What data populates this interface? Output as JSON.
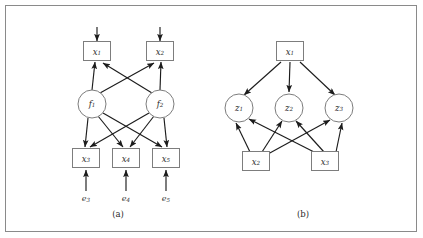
{
  "figure": {
    "background_color": "#ffffff",
    "border_color": "#8a8a8a",
    "edge_color": "#1c1c1c",
    "node_stroke_color": "#7d7d7d"
  },
  "panels": [
    {
      "id": "a",
      "caption": "(a)",
      "caption_x": 118,
      "caption_y": 214,
      "observed_top": [
        {
          "name": "x1",
          "label": "x",
          "sub": "1",
          "x": 97,
          "y": 51,
          "w": 27,
          "h": 19
        },
        {
          "name": "x2",
          "label": "x",
          "sub": "2",
          "x": 160,
          "y": 51,
          "w": 27,
          "h": 19
        }
      ],
      "latent": [
        {
          "name": "f1",
          "label": "f",
          "sub": "1",
          "x": 92,
          "y": 104,
          "r": 14
        },
        {
          "name": "f2",
          "label": "f",
          "sub": "2",
          "x": 160,
          "y": 104,
          "r": 14
        }
      ],
      "observed_bottom": [
        {
          "name": "x3",
          "label": "x",
          "sub": "3",
          "x": 86,
          "y": 158,
          "w": 27,
          "h": 19
        },
        {
          "name": "x4",
          "label": "x",
          "sub": "4",
          "x": 126,
          "y": 158,
          "w": 27,
          "h": 19
        },
        {
          "name": "x5",
          "label": "x",
          "sub": "5",
          "x": 166,
          "y": 158,
          "w": 27,
          "h": 19
        }
      ],
      "errors": [
        {
          "name": "e3",
          "label": "e",
          "sub": "3",
          "x": 86,
          "y": 199
        },
        {
          "name": "e4",
          "label": "e",
          "sub": "4",
          "x": 126,
          "y": 199
        },
        {
          "name": "e5",
          "label": "e",
          "sub": "5",
          "x": 166,
          "y": 199
        }
      ],
      "exogenous_arrows": [
        {
          "name": "arrow-into-x1",
          "x": 97,
          "y_from": 27,
          "y_to": 41
        },
        {
          "name": "arrow-into-x2",
          "x": 160,
          "y_from": 27,
          "y_to": 41
        }
      ]
    },
    {
      "id": "b",
      "caption": "(b)",
      "caption_x": 303,
      "caption_y": 214,
      "observed_top": [
        {
          "name": "x1",
          "label": "x",
          "sub": "1",
          "x": 290,
          "y": 51,
          "w": 27,
          "h": 19
        }
      ],
      "latent": [
        {
          "name": "z1",
          "label": "z",
          "sub": "1",
          "x": 239,
          "y": 108,
          "r": 14
        },
        {
          "name": "z2",
          "label": "z",
          "sub": "2",
          "x": 289,
          "y": 108,
          "r": 14
        },
        {
          "name": "z3",
          "label": "z",
          "sub": "3",
          "x": 339,
          "y": 108,
          "r": 14
        }
      ],
      "observed_bottom": [
        {
          "name": "x2",
          "label": "x",
          "sub": "2",
          "x": 256,
          "y": 161,
          "w": 27,
          "h": 19
        },
        {
          "name": "x3",
          "label": "x",
          "sub": "3",
          "x": 325,
          "y": 161,
          "w": 27,
          "h": 19
        }
      ]
    }
  ]
}
